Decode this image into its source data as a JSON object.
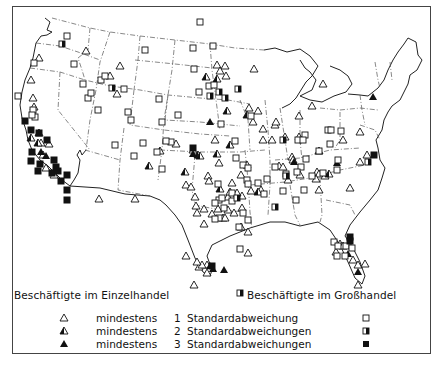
{
  "legend": {
    "left_header": "Beschäftigte im Einzelhandel",
    "right_header": "Beschäftigte im Großhandel",
    "rows": [
      {
        "retail_symbol": "triangle-open",
        "prefix": "mindestens",
        "count": "1",
        "label": "Standardabweichung",
        "wholesale_symbol": "square-open"
      },
      {
        "retail_symbol": "triangle-half",
        "prefix": "mindestens",
        "count": "2",
        "label": "Standardabweichungen",
        "wholesale_symbol": "square-half"
      },
      {
        "retail_symbol": "triangle-filled",
        "prefix": "mindestens",
        "count": "3",
        "label": "Standardabweichungen",
        "wholesale_symbol": "square-filled"
      }
    ]
  },
  "colors": {
    "ink": "#111111",
    "border": "#444444",
    "boundary": "#555555",
    "background": "#ffffff"
  },
  "markers": {
    "triangles_open": [
      [
        39,
        58
      ],
      [
        31,
        80
      ],
      [
        33,
        98
      ],
      [
        34,
        107
      ],
      [
        86,
        51
      ],
      [
        120,
        66
      ],
      [
        110,
        76
      ],
      [
        117,
        94
      ],
      [
        41,
        143
      ],
      [
        49,
        144
      ],
      [
        43,
        155
      ],
      [
        46,
        168
      ],
      [
        54,
        175
      ],
      [
        99,
        199
      ],
      [
        135,
        199
      ],
      [
        176,
        144
      ],
      [
        193,
        150
      ],
      [
        215,
        140
      ],
      [
        219,
        163
      ],
      [
        208,
        176
      ],
      [
        209,
        181
      ],
      [
        186,
        185
      ],
      [
        191,
        187
      ],
      [
        195,
        197
      ],
      [
        196,
        206
      ],
      [
        197,
        213
      ],
      [
        204,
        209
      ],
      [
        218,
        209
      ],
      [
        228,
        210
      ],
      [
        234,
        213
      ],
      [
        228,
        197
      ],
      [
        230,
        192
      ],
      [
        232,
        183
      ],
      [
        242,
        196
      ],
      [
        251,
        191
      ],
      [
        241,
        175
      ],
      [
        247,
        165
      ],
      [
        223,
        218
      ],
      [
        225,
        218
      ],
      [
        212,
        214
      ],
      [
        241,
        227
      ],
      [
        204,
        224
      ],
      [
        248,
        232
      ],
      [
        242,
        208
      ],
      [
        248,
        253
      ],
      [
        186,
        256
      ],
      [
        207,
        265
      ],
      [
        207,
        273
      ],
      [
        237,
        193
      ],
      [
        261,
        190
      ],
      [
        288,
        180
      ],
      [
        285,
        137
      ],
      [
        272,
        140
      ],
      [
        279,
        166
      ],
      [
        254,
        69
      ],
      [
        217,
        65
      ],
      [
        225,
        66
      ],
      [
        220,
        71
      ],
      [
        226,
        76
      ],
      [
        249,
        108
      ],
      [
        258,
        111
      ],
      [
        253,
        122
      ],
      [
        263,
        129
      ],
      [
        275,
        125
      ],
      [
        263,
        140
      ],
      [
        276,
        122
      ],
      [
        299,
        137
      ],
      [
        299,
        116
      ],
      [
        323,
        84
      ],
      [
        312,
        106
      ],
      [
        319,
        151
      ],
      [
        317,
        172
      ],
      [
        292,
        157
      ],
      [
        293,
        160
      ],
      [
        283,
        167
      ],
      [
        300,
        175
      ],
      [
        319,
        174
      ],
      [
        316,
        179
      ],
      [
        325,
        176
      ],
      [
        343,
        140
      ],
      [
        360,
        162
      ],
      [
        350,
        188
      ],
      [
        319,
        190
      ],
      [
        367,
        155
      ],
      [
        360,
        132
      ],
      [
        336,
        252
      ],
      [
        340,
        244
      ],
      [
        343,
        246
      ],
      [
        353,
        260
      ],
      [
        358,
        265
      ],
      [
        365,
        264
      ],
      [
        358,
        285
      ],
      [
        194,
        285
      ],
      [
        199,
        267
      ],
      [
        202,
        265
      ],
      [
        197,
        262
      ]
    ],
    "triangles_half": [
      [
        206,
        77
      ],
      [
        217,
        79
      ],
      [
        227,
        111
      ],
      [
        247,
        115
      ],
      [
        329,
        174
      ],
      [
        149,
        166
      ],
      [
        160,
        151
      ],
      [
        185,
        172
      ],
      [
        220,
        189
      ],
      [
        258,
        192
      ],
      [
        230,
        145
      ],
      [
        198,
        155
      ],
      [
        200,
        156
      ],
      [
        217,
        154
      ],
      [
        31,
        138
      ],
      [
        39,
        133
      ],
      [
        38,
        143
      ]
    ],
    "triangles_filled": [
      [
        210,
        122
      ],
      [
        373,
        97
      ],
      [
        348,
        254
      ],
      [
        358,
        272
      ],
      [
        210,
        266
      ],
      [
        213,
        269
      ],
      [
        337,
        163
      ],
      [
        46,
        156
      ],
      [
        41,
        152
      ],
      [
        294,
        162
      ],
      [
        224,
        270
      ],
      [
        193,
        154
      ]
    ],
    "squares_open": [
      [
        67,
        36
      ],
      [
        145,
        50
      ],
      [
        193,
        48
      ],
      [
        194,
        69
      ],
      [
        209,
        86
      ],
      [
        171,
        142
      ],
      [
        214,
        85
      ],
      [
        199,
        92
      ],
      [
        74,
        64
      ],
      [
        83,
        84
      ],
      [
        159,
        99
      ],
      [
        166,
        141
      ],
      [
        162,
        122
      ],
      [
        124,
        89
      ],
      [
        134,
        156
      ],
      [
        157,
        152
      ],
      [
        128,
        112
      ],
      [
        115,
        145
      ],
      [
        162,
        169
      ],
      [
        98,
        110
      ],
      [
        143,
        143
      ],
      [
        178,
        115
      ],
      [
        88,
        98
      ],
      [
        221,
        124
      ],
      [
        251,
        116
      ],
      [
        298,
        140
      ],
      [
        305,
        135
      ],
      [
        247,
        180
      ],
      [
        264,
        194
      ],
      [
        306,
        159
      ],
      [
        328,
        130
      ],
      [
        303,
        140
      ],
      [
        267,
        179
      ],
      [
        301,
        167
      ],
      [
        319,
        151
      ],
      [
        341,
        131
      ],
      [
        330,
        144
      ],
      [
        338,
        160
      ],
      [
        337,
        170
      ],
      [
        312,
        176
      ],
      [
        323,
        173
      ],
      [
        304,
        190
      ],
      [
        235,
        141
      ],
      [
        236,
        158
      ],
      [
        243,
        165
      ],
      [
        258,
        183
      ],
      [
        297,
        172
      ],
      [
        248,
        168
      ],
      [
        286,
        174
      ],
      [
        248,
        184
      ],
      [
        219,
        200
      ],
      [
        219,
        218
      ],
      [
        215,
        219
      ],
      [
        240,
        249
      ],
      [
        243,
        213
      ],
      [
        248,
        220
      ],
      [
        232,
        201
      ],
      [
        239,
        227
      ],
      [
        275,
        167
      ],
      [
        296,
        200
      ],
      [
        283,
        191
      ],
      [
        334,
        242
      ],
      [
        338,
        246
      ],
      [
        337,
        256
      ],
      [
        345,
        256
      ],
      [
        346,
        246
      ],
      [
        352,
        248
      ],
      [
        34,
        63
      ],
      [
        33,
        110
      ],
      [
        35,
        117
      ],
      [
        32,
        115
      ],
      [
        18,
        96
      ],
      [
        91,
        93
      ],
      [
        131,
        120
      ],
      [
        101,
        80
      ],
      [
        105,
        76
      ],
      [
        232,
        193
      ],
      [
        215,
        203
      ],
      [
        222,
        198
      ],
      [
        224,
        208
      ],
      [
        218,
        184
      ],
      [
        331,
        130
      ],
      [
        213,
        46
      ],
      [
        200,
        22
      ]
    ],
    "squares_half": [
      [
        62,
        44
      ],
      [
        112,
        88
      ],
      [
        219,
        92
      ],
      [
        210,
        96
      ],
      [
        225,
        98
      ],
      [
        238,
        89
      ],
      [
        275,
        207
      ],
      [
        240,
        293
      ],
      [
        286,
        176
      ],
      [
        283,
        140
      ],
      [
        237,
        198
      ],
      [
        368,
        162
      ]
    ],
    "squares_filled": [
      [
        47,
        140
      ],
      [
        39,
        133
      ],
      [
        25,
        121
      ],
      [
        31,
        161
      ],
      [
        40,
        164
      ],
      [
        32,
        152
      ],
      [
        38,
        171
      ],
      [
        193,
        148
      ],
      [
        374,
        155
      ],
      [
        350,
        237
      ],
      [
        52,
        173
      ],
      [
        61,
        181
      ],
      [
        58,
        171
      ],
      [
        67,
        175
      ],
      [
        67,
        190
      ],
      [
        67,
        200
      ],
      [
        56,
        167
      ],
      [
        54,
        160
      ],
      [
        31,
        130
      ],
      [
        212,
        266
      ],
      [
        350,
        241
      ]
    ]
  }
}
